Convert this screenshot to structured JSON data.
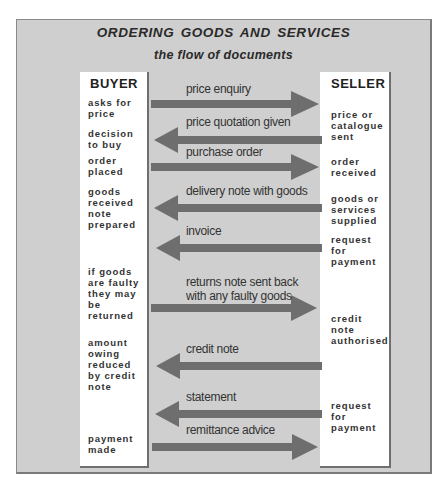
{
  "title": "ORDERING  GOODS AND SERVICES",
  "subtitle": "the flow of documents",
  "colors": {
    "panel": "#cfcfcf",
    "arrow": "#6e6e6e",
    "box": "#ffffff"
  },
  "buyer": {
    "heading": "BUYER",
    "notes": [
      "asks for\nprice",
      "decision\nto buy",
      "order\nplaced",
      "goods\nreceived\nnote\nprepared",
      "if goods\nare faulty\nthey may\nbe\nreturned",
      "amount\nowing\nreduced\nby credit\nnote",
      "payment\nmade"
    ]
  },
  "seller": {
    "heading": "SELLER",
    "notes": [
      "price or\ncatalogue\nsent",
      "order\nreceived",
      "goods or\nservices\nsupplied",
      "request\nfor\npayment",
      "credit\nnote\nauthorised",
      "request\nfor\npayment"
    ]
  },
  "flows": [
    {
      "label": "price enquiry",
      "direction": "to-seller"
    },
    {
      "label": "price quotation given",
      "direction": "to-buyer"
    },
    {
      "label": "purchase order",
      "direction": "to-seller"
    },
    {
      "label": "delivery note with goods",
      "direction": "to-buyer"
    },
    {
      "label": "invoice",
      "direction": "to-buyer"
    },
    {
      "label": "returns note sent back\nwith any faulty goods",
      "direction": "to-seller"
    },
    {
      "label": "credit note",
      "direction": "to-buyer"
    },
    {
      "label": "statement",
      "direction": "to-buyer"
    },
    {
      "label": "remittance advice",
      "direction": "to-seller"
    }
  ]
}
